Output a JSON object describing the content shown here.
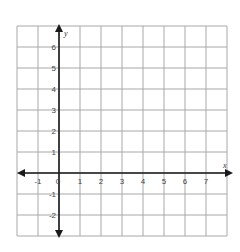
{
  "chart_data": {
    "type": "scatter",
    "title": "",
    "xlabel": "x",
    "ylabel": "y",
    "xlim": [
      -2,
      8
    ],
    "ylim": [
      -3,
      7
    ],
    "grid": true,
    "x_ticks": [
      -1,
      0,
      1,
      2,
      3,
      4,
      5,
      6,
      7
    ],
    "y_ticks": [
      -2,
      -1,
      1,
      2,
      3,
      4,
      5,
      6
    ],
    "x_tick_labels": [
      "-1",
      "0",
      "1",
      "2",
      "3",
      "4",
      "5",
      "6",
      "7"
    ],
    "y_tick_labels": [
      "-2",
      "-1",
      "1",
      "2",
      "3",
      "4",
      "5",
      "6"
    ],
    "origin_label": "0",
    "series": [],
    "layout": {
      "grid_left": 17,
      "grid_top": 26,
      "cell": 21,
      "cols": 10,
      "rows": 10,
      "colors": {
        "grid": "#a8a8a8",
        "axis": "#1a1a1a",
        "tick_text": "#444444"
      }
    }
  }
}
